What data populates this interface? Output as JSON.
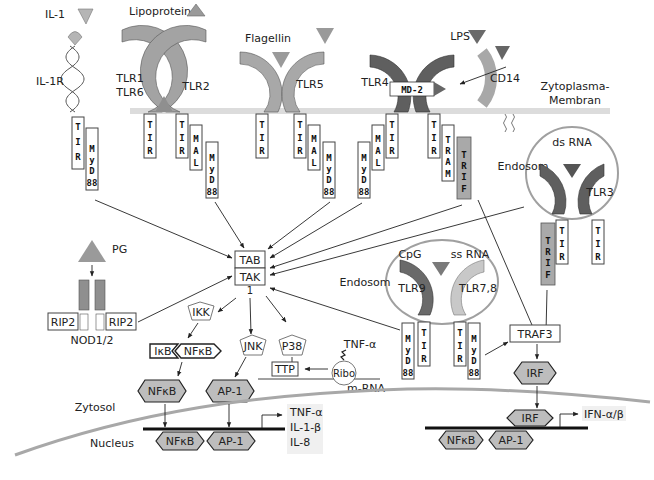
{
  "diagram": {
    "type": "Toll-like receptor signaling pathways",
    "membrane_label": "Zytoplasma-\nMembran",
    "membrane_label_lines": [
      "Zytoplasma-",
      "Membran"
    ],
    "compartments": {
      "cytosol": "Zytosol",
      "nucleus": "Nucleus",
      "endosome_1": "Endosom",
      "endosome_2": "Endosom"
    },
    "ligands": {
      "il1": "IL-1",
      "lipoprotein": "Lipoprotein",
      "flagellin": "Flagellin",
      "lps": "LPS",
      "dsrna": "ds RNA",
      "cpg": "CpG",
      "ssrna": "ss RNA",
      "pg": "PG"
    },
    "receptors": {
      "il1r": "IL-1R",
      "tlr1_6": [
        "TLR1",
        "TLR6"
      ],
      "tlr2": "TLR2",
      "tlr5": "TLR5",
      "tlr4": "TLR4",
      "md2": "MD-2",
      "cd14": "CD14",
      "tlr3": "TLR3",
      "tlr9": "TLR9",
      "tlr78": "TLR7,8",
      "nod": "NOD1/2",
      "rip2_left": "RIP2",
      "rip2_right": "RIP2"
    },
    "adaptors": {
      "tir": [
        "T",
        "I",
        "R"
      ],
      "mal": [
        "M",
        "A",
        "L"
      ],
      "myd88": [
        "M",
        "y",
        "D",
        "88"
      ],
      "tram": [
        "T",
        "R",
        "A",
        "M"
      ],
      "trif": [
        "T",
        "R",
        "I",
        "F"
      ]
    },
    "kinases": {
      "tab": "TAB",
      "tak": "TAK",
      "tak_sub": "1",
      "ikk": "IKK",
      "jnk": "JNK",
      "p38": "P38",
      "traf3": "TRAF3"
    },
    "factors": {
      "ikb": "IκB",
      "nfkb": "NFκB",
      "ap1": "AP-1",
      "irf": "IRF",
      "ttp": "TTP",
      "ribo": "Ribo",
      "mrna": "m-RNA",
      "tnfa_mrna": "TNF-α"
    },
    "outputs": {
      "cytokines": [
        "TNF-α",
        "IL-1-β",
        "IL-8"
      ],
      "interferon": "IFN-α/β"
    },
    "colors": {
      "light_receptor": "#b5b5b5",
      "mid_receptor": "#8f8f8f",
      "dark_receptor": "#5f5f5f",
      "tlr78": "#c8c8c8",
      "trif": "#a9a9a9",
      "factor_fill": "#bdbdbd",
      "membrane": "#d8d8d8",
      "nuclear_envelope": "#a8a8a8",
      "endosome": "#a0a0a0"
    }
  }
}
